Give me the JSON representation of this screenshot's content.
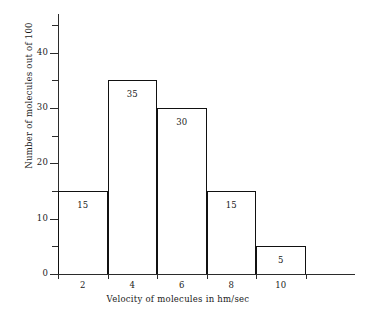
{
  "chart_data": {
    "type": "bar",
    "title": "",
    "xlabel": "Velocity of molecules in hm/sec",
    "ylabel": "Number of molecules out of 100",
    "categories": [
      "2",
      "4",
      "6",
      "8",
      "10"
    ],
    "values": [
      15,
      35,
      30,
      15,
      5
    ],
    "bin_edges": [
      1,
      3,
      5,
      7,
      9,
      11
    ],
    "bars": [
      {
        "label": "2",
        "value": 15,
        "value_label": "15",
        "bin_start": 1,
        "bin_end": 3
      },
      {
        "label": "4",
        "value": 35,
        "value_label": "35",
        "bin_start": 3,
        "bin_end": 5
      },
      {
        "label": "6",
        "value": 30,
        "value_label": "30",
        "bin_start": 5,
        "bin_end": 7
      },
      {
        "label": "8",
        "value": 15,
        "value_label": "15",
        "bin_start": 7,
        "bin_end": 9
      },
      {
        "label": "10",
        "value": 5,
        "value_label": "5",
        "bin_start": 9,
        "bin_end": 11
      }
    ],
    "xlim": [
      1,
      13
    ],
    "ylim": [
      0,
      47
    ],
    "ytick_major": [
      0,
      10,
      20,
      30,
      40
    ],
    "ytick_major_labels": [
      "0",
      "10",
      "20",
      "30",
      "40"
    ],
    "ytick_minor": [
      5,
      15,
      25,
      35,
      45
    ],
    "xticks": [
      2,
      4,
      6,
      8,
      10
    ],
    "xtick_labels": [
      "2",
      "4",
      "6",
      "8",
      "10"
    ],
    "grid": false,
    "legend": null,
    "colors": {
      "bar_fill": "#ffffff",
      "bar_outline": "#111111",
      "axis": "#2b2b2b",
      "text": "#1a1a1a",
      "background": "#ffffff"
    }
  }
}
